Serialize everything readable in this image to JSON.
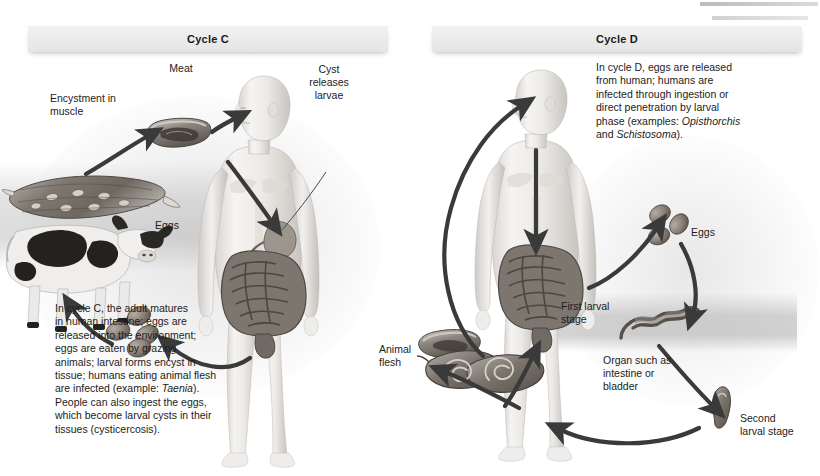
{
  "figure": {
    "title_c": "Cycle C",
    "title_d": "Cycle D"
  },
  "cycle_c": {
    "header": "Cycle C",
    "labels": {
      "encystment": "Encystment in\nmuscle",
      "meat": "Meat",
      "cyst": "Cyst\nreleases\nlarvae",
      "eggs": "Eggs"
    },
    "caption_line1": "In cycle C, the adult matures",
    "caption_line2": "in human intestine; eggs are",
    "caption_line3": "released into the environment;",
    "caption_line4": "eggs are eaten by grazing",
    "caption_line5": "animals; larval forms encyst in",
    "caption_line6": "tissue; humans eating animal flesh",
    "caption_line7_pre": "are infected (example: ",
    "caption_line7_italic": "Taenia",
    "caption_line7_post": ").",
    "caption_line8": "People can also ingest the eggs,",
    "caption_line9": "which become larval cysts in their",
    "caption_line10": "tissues (cysticercosis).",
    "figures": {
      "human": "human-figure",
      "cow": "cow-figure",
      "muscle": "encysted-muscle-figure",
      "meat": "meat-cut-figure",
      "eggs": "eggs-cluster-figure"
    }
  },
  "cycle_d": {
    "header": "Cycle D",
    "labels": {
      "eggs": "Eggs",
      "first_larval": "First larval\nstage",
      "second_larval": "Second\nlarval stage",
      "organ": "Organ such as\nintestine or\nbladder",
      "animal_flesh": "Animal\nflesh"
    },
    "caption_line1": "In cycle D, eggs are released",
    "caption_line2": "from human; humans are",
    "caption_line3": "infected through ingestion or",
    "caption_line4": "direct penetration by larval",
    "caption_line5_pre": "phase (examples: ",
    "caption_line5_italic": "Opisthorchis",
    "caption_line6_pre": "and ",
    "caption_line6_italic": "Schistosoma",
    "caption_line6_post": ").",
    "figures": {
      "human": "human-figure",
      "eggs": "eggs-cluster-figure",
      "first_larva": "first-larval-stage-figure",
      "second_larva": "second-larval-stage-figure",
      "animal_flesh": "animal-flesh-figure"
    }
  },
  "colors": {
    "arrow": "#3a3a3a",
    "text": "#1c1c1c",
    "header_bg": "#ebebeb",
    "background": "#ffffff",
    "skin_light": "#f3f1ef",
    "skin_shade": "#c9c5c2",
    "intestine": "#6e6a66",
    "egg": "#8d8279"
  }
}
